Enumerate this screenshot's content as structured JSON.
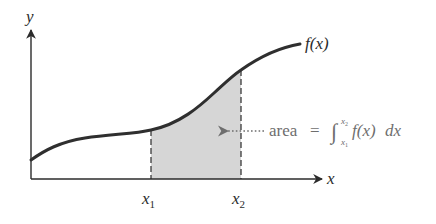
{
  "diagram": {
    "type": "definite-integral-illustration",
    "axes": {
      "x_label": "x",
      "y_label": "y"
    },
    "curve": {
      "label": "f(x)",
      "stroke_color": "#2f2f2f"
    },
    "bounds": {
      "lower_label_base": "x",
      "lower_label_sub": "1",
      "upper_label_base": "x",
      "upper_label_sub": "2"
    },
    "shaded_region": {
      "fill_color": "#d6d6d6"
    },
    "annotation": {
      "word": "area",
      "equals": "=",
      "integral_sign": "∫",
      "upper_limit_base": "x",
      "upper_limit_sub": "2",
      "lower_limit_base": "x",
      "lower_limit_sub": "1",
      "integrand": "f(x)",
      "differential": "dx",
      "text_color": "#6e6e6e"
    }
  }
}
